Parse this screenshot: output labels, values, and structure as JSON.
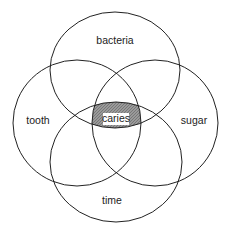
{
  "diagram": {
    "type": "venn",
    "sets": [
      {
        "id": "bacteria",
        "label": "bacteria"
      },
      {
        "id": "tooth",
        "label": "tooth"
      },
      {
        "id": "sugar",
        "label": "sugar"
      },
      {
        "id": "time",
        "label": "time"
      }
    ],
    "intersection": {
      "label": "caries",
      "sets": [
        "bacteria",
        "tooth",
        "sugar",
        "time"
      ]
    },
    "colors": {
      "stroke": "#222222",
      "fill": "#8c8c8c",
      "background": "#ffffff"
    }
  }
}
